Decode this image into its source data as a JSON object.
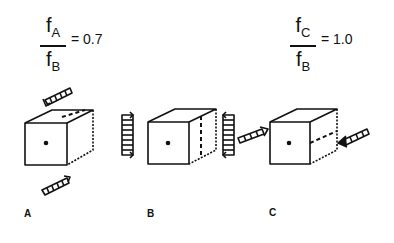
{
  "formulas": [
    {
      "id": "ratio-a-b",
      "numerator": "f",
      "numerator_sub": "A",
      "denominator": "f",
      "denominator_sub": "B",
      "equals": "= 0.7"
    },
    {
      "id": "ratio-c-b",
      "numerator": "f",
      "numerator_sub": "C",
      "denominator": "f",
      "denominator_sub": "B",
      "equals": "= 1.0"
    }
  ],
  "panels": [
    {
      "label": "A",
      "load_direction": "vertical (top and bottom faces)",
      "dashed_line": "top face"
    },
    {
      "label": "B",
      "load_direction": "lateral (left and right sides)",
      "dashed_line": "side face vertical"
    },
    {
      "label": "C",
      "load_direction": "longitudinal (front and back)",
      "dashed_line": "side face horizontal"
    }
  ],
  "colors": {
    "ink": "#111111",
    "background": "#ffffff"
  }
}
